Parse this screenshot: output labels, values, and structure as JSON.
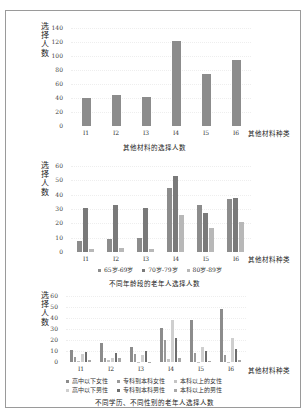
{
  "chart_data": [
    {
      "type": "bar",
      "title": "其他材料的选择人数",
      "xlabel": "其他材料种类",
      "ylabel": "选择人数",
      "categories": [
        "I1",
        "I2",
        "I3",
        "I4",
        "I5",
        "I6"
      ],
      "values": [
        40,
        44,
        41,
        122,
        75,
        94
      ],
      "yticks": [
        0,
        20,
        40,
        60,
        80,
        100,
        120,
        140
      ],
      "ylim": [
        0,
        140
      ],
      "color": "#8c8c8c"
    },
    {
      "type": "bar",
      "title": "不同年龄段的老年人选择人数",
      "xlabel": "其他材料种类",
      "ylabel": "选择人数",
      "categories": [
        "I1",
        "I2",
        "I3",
        "I4",
        "I5",
        "I6"
      ],
      "yticks": [
        0,
        10,
        20,
        30,
        40,
        50,
        60
      ],
      "ylim": [
        0,
        60
      ],
      "legend_position": "bottom",
      "series": [
        {
          "name": "65岁-69岁",
          "color": "#8c8c8c",
          "values": [
            8,
            9,
            10,
            45,
            33,
            37
          ]
        },
        {
          "name": "70岁-79岁",
          "color": "#7a7a7a",
          "values": [
            31,
            33,
            31,
            53,
            27,
            38
          ]
        },
        {
          "name": "80岁-89岁",
          "color": "#b8b8b8",
          "values": [
            2,
            3,
            2,
            26,
            17,
            21
          ]
        }
      ]
    },
    {
      "type": "bar",
      "title": "不同学历、不同性别的老年人选择人数",
      "xlabel": "其他材料种类",
      "ylabel": "选择人数",
      "categories": [
        "I1",
        "I2",
        "I3",
        "I4",
        "I5",
        "I6"
      ],
      "yticks": [
        0,
        10,
        20,
        30,
        40,
        50,
        60
      ],
      "ylim": [
        0,
        60
      ],
      "legend_position": "bottom",
      "series": [
        {
          "name": "高中以下女性",
          "color": "#8c8c8c",
          "values": [
            11,
            17,
            14,
            31,
            38,
            48
          ]
        },
        {
          "name": "专科到本科女性",
          "color": "#9a9a9a",
          "values": [
            5,
            4,
            7,
            20,
            8,
            6
          ]
        },
        {
          "name": "本科以上的女性",
          "color": "#c4c4c4",
          "values": [
            1,
            2,
            0,
            3,
            0,
            0
          ]
        },
        {
          "name": "高中以下男性",
          "color": "#cfcfcf",
          "values": [
            7,
            4,
            6,
            38,
            14,
            22
          ]
        },
        {
          "name": "专科到本科男性",
          "color": "#6e6e6e",
          "values": [
            9,
            8,
            10,
            22,
            10,
            12
          ]
        },
        {
          "name": "本科以上的男性",
          "color": "#a8a8a8",
          "values": [
            2,
            4,
            0,
            4,
            1,
            2
          ]
        }
      ]
    }
  ],
  "charts": {
    "c1": {
      "ylabel": "选择人数",
      "xlabel": "其他材料种类",
      "caption": "其他材料的选择人数"
    },
    "c2": {
      "ylabel": "选择人数",
      "xlabel": "其他材料种类",
      "caption": "不同年龄段的老年人选择人数"
    },
    "c3": {
      "ylabel": "选择人数",
      "xlabel": "其他材料种类",
      "caption": "不同学历、不同性别的老年人选择人数"
    }
  }
}
